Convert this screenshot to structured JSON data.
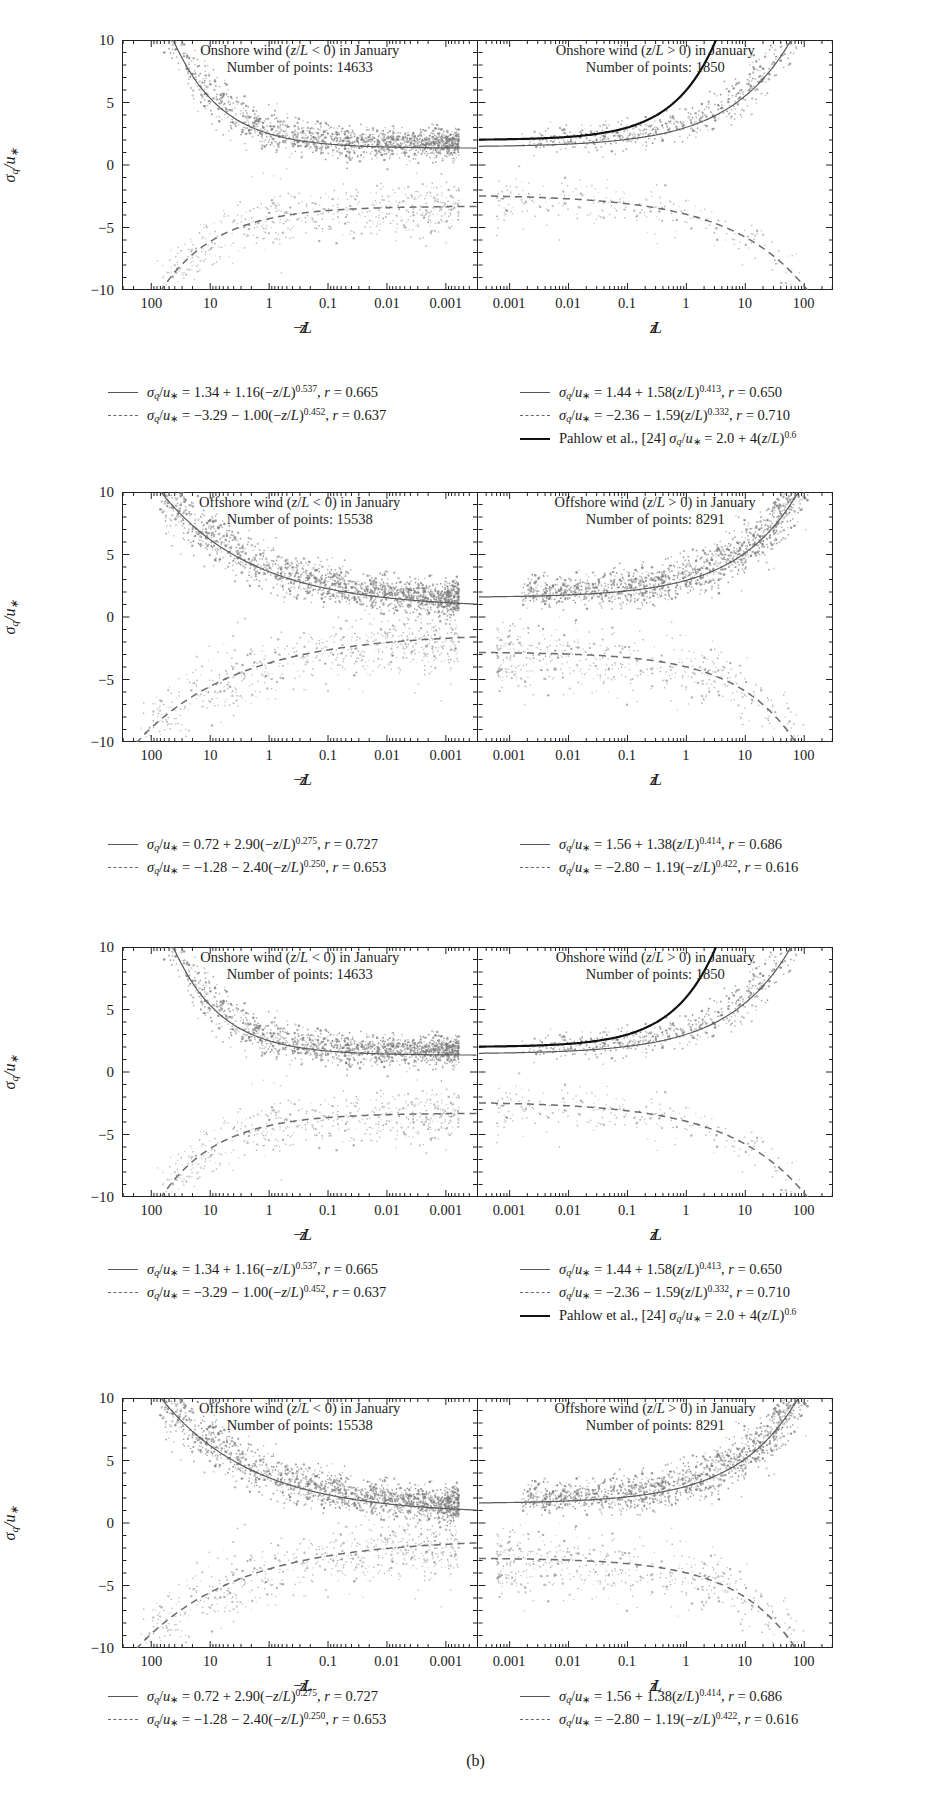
{
  "figure": {
    "caption": "(b)",
    "y_axis_label": "σ_q/u_*",
    "y_ticks": [
      "10",
      "5",
      "0",
      "-5",
      "-10"
    ],
    "y_range": [
      -10,
      10
    ],
    "x_ticks_left": [
      "100",
      "10",
      "1",
      "0.1",
      "0.01",
      "0.001"
    ],
    "x_ticks_right": [
      "0.001",
      "0.01",
      "0.1",
      "1",
      "10",
      "100"
    ],
    "x_title_left": "-z/L",
    "x_title_right": "z/L"
  },
  "chart_data": [
    {
      "type": "scatter",
      "index": 0,
      "panel": "left",
      "title_line1": "Onshore wind (z/L < 0) in January",
      "title_line2": "Number of points: 14633",
      "n_points": 14633,
      "xlabel": "-z/L",
      "ylabel": "σ_q/u_*",
      "xscale": "log-reversed",
      "xlim": [
        0.0003,
        300
      ],
      "ylim": [
        -10,
        10
      ],
      "grid": false,
      "fits": [
        {
          "style": "solid",
          "a": 1.34,
          "b": 1.16,
          "exp": 0.537,
          "r": 0.665,
          "sign": "+"
        },
        {
          "style": "dashed",
          "a": -3.29,
          "b": -1.0,
          "exp": 0.452,
          "r": 0.637,
          "sign": "-"
        }
      ],
      "cloud": {
        "center_y": 1.6,
        "spread": 1.0,
        "n_draw": 1500,
        "lower_center": -3.4
      }
    },
    {
      "type": "scatter",
      "index": 1,
      "panel": "right",
      "title_line1": "Onshore wind (z/L > 0) in January",
      "title_line2": "Number of points: 1850",
      "n_points": 1850,
      "xlabel": "z/L",
      "ylabel": "σ_q/u_*",
      "xscale": "log",
      "xlim": [
        0.0003,
        300
      ],
      "ylim": [
        -10,
        10
      ],
      "grid": false,
      "fits": [
        {
          "style": "solid",
          "a": 1.44,
          "b": 1.58,
          "exp": 0.413,
          "r": 0.65,
          "sign": "+"
        },
        {
          "style": "dashed",
          "a": -2.36,
          "b": -1.59,
          "exp": 0.332,
          "r": 0.71,
          "sign": "-"
        },
        {
          "style": "bold",
          "a": 2.0,
          "b": 4.0,
          "exp": 0.6,
          "r": null,
          "sign": "+",
          "reference": "Pahlow et al., [24]"
        }
      ],
      "cloud": {
        "center_y": 1.5,
        "spread": 0.8,
        "n_draw": 600,
        "lower_center": -2.6
      }
    },
    {
      "type": "scatter",
      "index": 2,
      "panel": "left",
      "title_line1": "Offshore wind (z/L < 0) in January",
      "title_line2": "Number of points: 15538",
      "n_points": 15538,
      "xlabel": "-z/L",
      "ylabel": "σ_q/u_*",
      "xscale": "log-reversed",
      "xlim": [
        0.0003,
        300
      ],
      "ylim": [
        -10,
        10
      ],
      "grid": false,
      "fits": [
        {
          "style": "solid",
          "a": 0.72,
          "b": 2.9,
          "exp": 0.275,
          "r": 0.727,
          "sign": "+"
        },
        {
          "style": "dashed",
          "a": -1.28,
          "b": -2.4,
          "exp": 0.25,
          "r": 0.653,
          "sign": "-"
        }
      ],
      "cloud": {
        "center_y": 2.2,
        "spread": 1.2,
        "n_draw": 1700,
        "lower_center": -2.8
      }
    },
    {
      "type": "scatter",
      "index": 3,
      "panel": "right",
      "title_line1": "Offshore wind (z/L > 0) in January",
      "title_line2": "Number of points: 8291",
      "n_points": 8291,
      "xlabel": "z/L",
      "ylabel": "σ_q/u_*",
      "xscale": "log",
      "xlim": [
        0.0003,
        300
      ],
      "ylim": [
        -10,
        10
      ],
      "grid": false,
      "fits": [
        {
          "style": "solid",
          "a": 1.56,
          "b": 1.38,
          "exp": 0.414,
          "r": 0.686,
          "sign": "+"
        },
        {
          "style": "dashed",
          "a": -2.8,
          "b": -1.19,
          "exp": 0.422,
          "r": 0.616,
          "sign": "-"
        }
      ],
      "cloud": {
        "center_y": 2.0,
        "spread": 1.1,
        "n_draw": 1400,
        "lower_center": -2.9
      }
    }
  ],
  "charts": [
    {
      "left_title_l1": "Onshore wind (z/L < 0) in January",
      "left_title_l2": "Number of points: 14633",
      "right_title_l1": "Onshore wind (z/L > 0) in January",
      "right_title_l2": "Number of points: 1850"
    },
    {
      "left_title_l1": "Offshore wind (z/L < 0) in January",
      "left_title_l2": "Number of points: 15538",
      "right_title_l1": "Offshore wind (z/L > 0) in January",
      "right_title_l2": "Number of points: 8291"
    },
    {
      "left_title_l1": "Onshore wind (z/L < 0) in January",
      "left_title_l2": "Number of points: 14633",
      "right_title_l1": "Onshore wind (z/L > 0) in January",
      "right_title_l2": "Number of points:  1850"
    },
    {
      "left_title_l1": "Offshore wind (z/L < 0) in January",
      "left_title_l2": "Number of points: 15538",
      "right_title_l1": "Offshore wind (z/L > 0) in January",
      "right_title_l2": "Number of points:  8291"
    }
  ],
  "legends": [
    {
      "left": [
        {
          "style": "solid",
          "text": "σ_q/u_* = 1.34 + 1.16(-z/L)^0.537, r = 0.665"
        },
        {
          "style": "dashed",
          "text": "σ_q/u_* = -3.29 - 1.00(-z/L)^0.452, r = 0.637"
        }
      ],
      "right": [
        {
          "style": "solid",
          "text": "σ_q/u_* = 1.44 + 1.58(z/L)^0.413, r = 0.650"
        },
        {
          "style": "dashed",
          "text": "σ_q/u_* = -2.36 - 1.59(z/L)^0.332, r = 0.710"
        },
        {
          "style": "bold",
          "text": "Pahlow et al., [24] σ_q/u_* = 2.0 + 4(z/L)^0.6"
        }
      ]
    },
    {
      "left": [
        {
          "style": "solid",
          "text": "σ_q/u_* = 0.72 + 2.90(-z/L)^0.275, r = 0.727"
        },
        {
          "style": "dashed",
          "text": "σ_q/u_* = -1.28 - 2.40(-z/L)^0.250, r = 0.653"
        }
      ],
      "right": [
        {
          "style": "solid",
          "text": "σ_q/u_* = 1.56 + 1.38(z/L)^0.414, r = 0.686"
        },
        {
          "style": "dashed",
          "text": "σ_q/u_* = -2.80 - 1.19(-z/L)^0.422, r = 0.616"
        }
      ]
    },
    {
      "left": [
        {
          "style": "solid",
          "text": "σ_q/u_* = 1.34 + 1.16(-z/L)^0.537, r = 0.665"
        },
        {
          "style": "dashed",
          "text": "σ_q/u_* = -3.29 - 1.00(-z/L)^0.452, r = 0.637"
        }
      ],
      "right": [
        {
          "style": "solid",
          "text": "σ_q/u_* = 1.44 + 1.58(z/L)^0.413, r = 0.650"
        },
        {
          "style": "dashed",
          "text": "σ_q/u_* = -2.36 - 1.59(z/L)^0.332, r = 0.710"
        },
        {
          "style": "bold",
          "text": "Pahlow et al., [24] σ_q/u_* = 2.0 + 4(z/L)^0.6"
        }
      ]
    },
    {
      "left": [
        {
          "style": "solid",
          "text": "σ_q/u_* = 0.72 + 2.90(-z/L)^0.275, r = 0.727"
        },
        {
          "style": "dashed",
          "text": "σ_q/u_* = -1.28 - 2.40(-z/L)^0.250, r = 0.653"
        }
      ],
      "right": [
        {
          "style": "solid",
          "text": "σ_q/u_* = 1.56 + 1.38(z/L)^0.414, r = 0.686"
        },
        {
          "style": "dashed",
          "text": "σ_q/u_* = -2.80 - 1.19(-z/L)^0.422, r = 0.616"
        }
      ]
    }
  ]
}
